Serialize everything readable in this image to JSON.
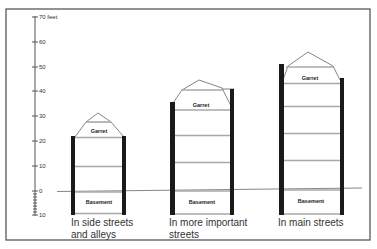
{
  "diagram": {
    "type": "building-height-comparison",
    "axis": {
      "unit_label": "70 feet",
      "ticks": [
        {
          "value": 70,
          "label": "70 feet",
          "y": 17
        },
        {
          "value": 60,
          "label": "60",
          "y": 42
        },
        {
          "value": 50,
          "label": "50",
          "y": 67
        },
        {
          "value": 40,
          "label": "40",
          "y": 91
        },
        {
          "value": 30,
          "label": "30",
          "y": 116
        },
        {
          "value": 20,
          "label": "20",
          "y": 141
        },
        {
          "value": 10,
          "label": "10",
          "y": 166
        },
        {
          "value": 0,
          "label": "0",
          "y": 191
        },
        {
          "value": -10,
          "label": "10",
          "y": 215
        }
      ]
    },
    "buildings": [
      {
        "caption_line1": "In side streets",
        "caption_line2": "and alleys",
        "garret_label": "Garret",
        "basement_label": "Basement",
        "approx_height_feet": 30,
        "floors_above_ground": 2
      },
      {
        "caption_line1": "In more important",
        "caption_line2": "streets",
        "garret_label": "Garret",
        "basement_label": "Basement",
        "approx_height_feet": 45,
        "floors_above_ground": 3
      },
      {
        "caption_line1": "In main streets",
        "caption_line2": "",
        "garret_label": "Garret",
        "basement_label": "Basement",
        "approx_height_feet": 56,
        "floors_above_ground": 4
      }
    ]
  }
}
